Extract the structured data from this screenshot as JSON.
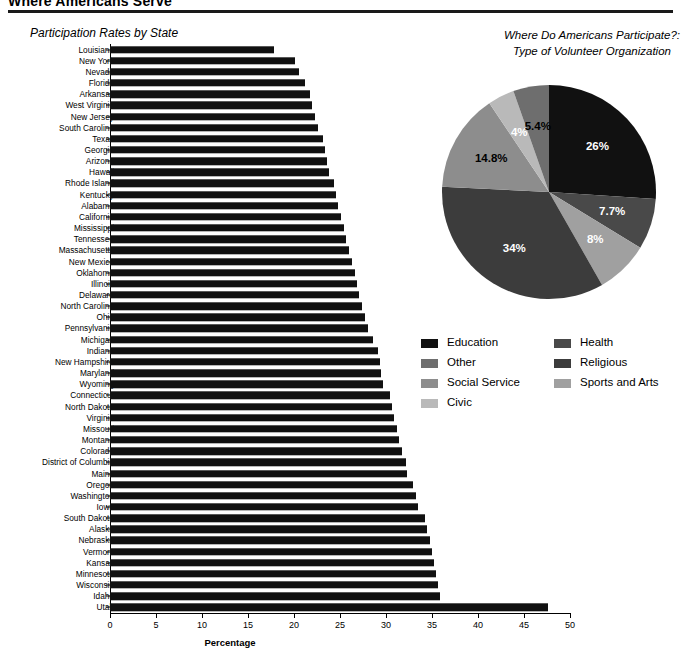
{
  "document": {
    "title": "Where Americans Serve"
  },
  "bar_section": {
    "title": "Participation Rates by State"
  },
  "pie_section": {
    "title_line1": "Where Do Americans Participate?:",
    "title_line2": "Type of Volunteer Organization"
  },
  "legend": {
    "left": [
      {
        "label": "Education",
        "color": "#111111"
      },
      {
        "label": "Other",
        "color": "#6e6e6e"
      },
      {
        "label": "Social Service",
        "color": "#8d8d8d"
      },
      {
        "label": "Civic",
        "color": "#b9b9b9"
      }
    ],
    "right": [
      {
        "label": "Health",
        "color": "#494949"
      },
      {
        "label": "Religious",
        "color": "#3c3c3c"
      },
      {
        "label": "Sports and Arts",
        "color": "#a0a0a0"
      }
    ]
  },
  "chart_data": [
    {
      "type": "bar",
      "orientation": "horizontal",
      "title": "Participation Rates by State",
      "xlabel": "Percentage",
      "ylabel": "",
      "xlim": [
        0,
        50
      ],
      "xticks": [
        0,
        5,
        10,
        15,
        20,
        25,
        30,
        35,
        40,
        45,
        50
      ],
      "grid": false,
      "bar_color": "#111111",
      "categories": [
        "Louisiana",
        "New York",
        "Nevada",
        "Florida",
        "Arkansas",
        "West Virginia",
        "New Jersey",
        "South Carolina",
        "Texas",
        "Georgia",
        "Arizona",
        "Hawaii",
        "Rhode Island",
        "Kentucky",
        "Alabama",
        "California",
        "Mississippi",
        "Tennessee",
        "Massachusetts",
        "New Mexico",
        "Oklahoma",
        "Illinois",
        "Delaware",
        "North Carolina",
        "Ohio",
        "Pennsylvania",
        "Michigan",
        "Indiana",
        "New Hampshire",
        "Maryland",
        "Wyoming",
        "Connecticut",
        "North Dakota",
        "Virginia",
        "Missouri",
        "Montana",
        "Colorado",
        "District of Columbia",
        "Maine",
        "Oregon",
        "Washington",
        "Iowa",
        "South Dakota",
        "Alaska",
        "Nebraska",
        "Vermont",
        "Kansas",
        "Minnesota",
        "Wisconsin",
        "Idaho",
        "Utah"
      ],
      "values": [
        17.8,
        20.1,
        20.5,
        21.2,
        21.7,
        22.0,
        22.3,
        22.6,
        23.1,
        23.4,
        23.6,
        23.8,
        24.4,
        24.6,
        24.8,
        25.1,
        25.4,
        25.7,
        26.0,
        26.3,
        26.6,
        26.9,
        27.1,
        27.4,
        27.7,
        28.0,
        28.6,
        29.1,
        29.3,
        29.5,
        29.7,
        30.4,
        30.6,
        30.9,
        31.2,
        31.4,
        31.7,
        32.2,
        32.3,
        32.9,
        33.3,
        33.5,
        34.2,
        34.5,
        34.8,
        35.0,
        35.2,
        35.4,
        35.6,
        35.9,
        47.6
      ]
    },
    {
      "type": "pie",
      "title": "Where Do Americans Participate?: Type of Volunteer Organization",
      "legend_position": "below",
      "start_angle_deg": 0,
      "direction": "clockwise",
      "labels": [
        "Education",
        "Health",
        "Sports and Arts",
        "Religious",
        "Social Service",
        "Civic",
        "Other"
      ],
      "values": [
        26,
        7.7,
        8,
        34,
        14.8,
        4,
        5.4
      ],
      "display_labels": [
        "26%",
        "7.7%",
        "8%",
        "34%",
        "14.8%",
        "4%",
        "5.4%"
      ],
      "colors": [
        "#111111",
        "#494949",
        "#a0a0a0",
        "#3c3c3c",
        "#8d8d8d",
        "#b9b9b9",
        "#6e6e6e"
      ],
      "label_text_colors": [
        "#ffffff",
        "#ffffff",
        "#ffffff",
        "#ffffff",
        "#000000",
        "#ffffff",
        "#000000"
      ]
    }
  ]
}
